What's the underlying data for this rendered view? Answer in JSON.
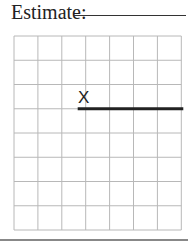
{
  "worksheet": {
    "prompt_label": "Estimate:",
    "answer_value": "",
    "grid": {
      "columns": 7,
      "rows": 8
    },
    "start_marker": "X",
    "segment": {
      "start_column": 3,
      "row_line": 3,
      "end_column": 7
    },
    "colors": {
      "grid_line": "#b8b8b8",
      "segment": "#222222",
      "text": "#222222"
    }
  }
}
